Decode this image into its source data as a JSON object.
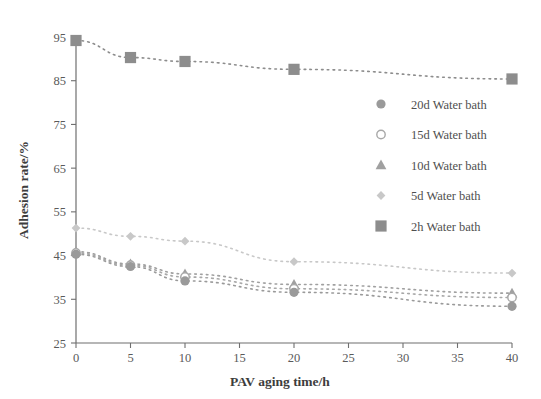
{
  "chart_data": {
    "type": "line",
    "title": "",
    "xlabel": "PAV aging time/h",
    "ylabel": "Adhesion rate/%",
    "xlim": [
      0,
      40
    ],
    "ylim": [
      25,
      95
    ],
    "xticks": [
      0,
      5,
      10,
      15,
      20,
      25,
      30,
      35,
      40
    ],
    "yticks": [
      25,
      35,
      45,
      55,
      65,
      75,
      85,
      95
    ],
    "grid": false,
    "legend_position": "center-right",
    "x": [
      0,
      5,
      10,
      20,
      40
    ],
    "series": [
      {
        "name": "20d Water bath",
        "marker": "filled-circle",
        "color": "#9a9a9a",
        "values": [
          45.3,
          42.5,
          39.2,
          36.6,
          33.4
        ]
      },
      {
        "name": "15d Water bath",
        "marker": "open-circle",
        "color": "#a8a8a8",
        "values": [
          45.6,
          42.8,
          40.1,
          37.4,
          35.4
        ]
      },
      {
        "name": "10d Water bath",
        "marker": "triangle",
        "color": "#a0a0a0",
        "values": [
          45.9,
          43.1,
          40.8,
          38.4,
          36.4
        ]
      },
      {
        "name": "5d Water bath",
        "marker": "small-diamond",
        "color": "#c8c8c8",
        "values": [
          51.3,
          49.4,
          48.3,
          43.6,
          41.0
        ]
      },
      {
        "name": "2h Water bath",
        "marker": "filled-square",
        "color": "#8d8d8d",
        "values": [
          94.2,
          90.3,
          89.4,
          87.6,
          85.4
        ]
      }
    ]
  },
  "axes": {
    "x_title": "PAV aging time/h",
    "y_title": "Adhesion rate/%",
    "x_tick_labels": [
      "0",
      "5",
      "10",
      "15",
      "20",
      "25",
      "30",
      "35",
      "40"
    ],
    "y_tick_labels": [
      "25",
      "35",
      "45",
      "55",
      "65",
      "75",
      "85",
      "95"
    ]
  },
  "legend": {
    "items": [
      {
        "label": "20d Water bath",
        "marker": "filled-circle"
      },
      {
        "label": "15d Water bath",
        "marker": "open-circle"
      },
      {
        "label": "10d Water bath",
        "marker": "triangle"
      },
      {
        "label": "5d Water bath",
        "marker": "small-diamond"
      },
      {
        "label": "2h Water bath",
        "marker": "filled-square"
      }
    ]
  },
  "colors": {
    "axis": "#6f6f6f",
    "text": "#4f4f4f",
    "series_2h": "#8d8d8d",
    "series_5d": "#c8c8c8",
    "series_10d": "#a0a0a0",
    "series_15d": "#a8a8a8",
    "series_20d": "#9a9a9a"
  }
}
